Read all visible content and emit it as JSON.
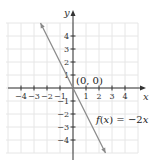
{
  "chart_data": {
    "type": "line",
    "title": "",
    "xlabel": "x",
    "ylabel": "y",
    "xlim": [
      -5,
      5
    ],
    "ylim": [
      -5,
      5
    ],
    "grid": true,
    "x_ticks": [
      -4,
      -3,
      -2,
      -1,
      1,
      2,
      3,
      4
    ],
    "y_ticks": [
      4,
      3,
      2,
      1,
      -1,
      -2,
      -3,
      -4
    ],
    "x_tick_labels": [
      "−4",
      "−3",
      "−2",
      "−1",
      "1",
      "2",
      "3",
      "4"
    ],
    "y_tick_labels": [
      "4",
      "3",
      "2",
      "1",
      "−1",
      "−2",
      "−3",
      "−4"
    ],
    "series": [
      {
        "name": "f(x) = −2x",
        "equation": "f(x) = -2x",
        "x": [
          -2.5,
          0,
          2.5
        ],
        "y": [
          5,
          0,
          -5
        ],
        "color": "#8a8a8a",
        "arrows": "both"
      }
    ],
    "annotations": [
      {
        "text": "(0, 0)",
        "x": 0,
        "y": 0
      },
      {
        "text": "f(x) = −2x",
        "x": 1.8,
        "y": -2.3
      }
    ]
  },
  "labels": {
    "x_axis": "x",
    "y_axis": "y",
    "origin": "(0, 0)",
    "function": "f(x) = −2x"
  },
  "colors": {
    "axis": "#333333",
    "grid": "#e6e6e6",
    "line": "#8a8a8a"
  }
}
